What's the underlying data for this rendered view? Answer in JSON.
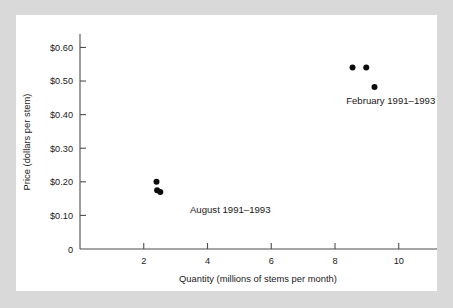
{
  "chart_data": {
    "type": "scatter",
    "title": "",
    "xlabel": "Quantity (millions of stems per month)",
    "ylabel": "Price (dollars per stem)",
    "xlim": [
      0,
      11.2
    ],
    "ylim": [
      0,
      0.64
    ],
    "xticks": [
      "2",
      "4",
      "6",
      "8",
      "10"
    ],
    "xtick_values": [
      2,
      4,
      6,
      8,
      10
    ],
    "yticks": [
      "$0.10",
      "$0.20",
      "$0.30",
      "$0.40",
      "$0.50",
      "$0.60"
    ],
    "ytick_values": [
      0.1,
      0.2,
      0.3,
      0.4,
      0.5,
      0.6
    ],
    "origin_label": "0",
    "grid": false,
    "legend_position": "inline-annotation",
    "series": [
      {
        "name": "August 1991–1993",
        "annotation": "August 1991–1993",
        "annotation_x": 3.45,
        "annotation_y": 0.108,
        "points": [
          {
            "x": 2.4,
            "y": 0.2
          },
          {
            "x": 2.42,
            "y": 0.175
          },
          {
            "x": 2.52,
            "y": 0.17
          }
        ]
      },
      {
        "name": "February 1991–1993",
        "annotation": "February 1991–1993",
        "annotation_x": 8.35,
        "annotation_y": 0.432,
        "points": [
          {
            "x": 8.55,
            "y": 0.54
          },
          {
            "x": 8.98,
            "y": 0.54
          },
          {
            "x": 9.24,
            "y": 0.482
          }
        ]
      }
    ],
    "colors": {
      "point": "#0d0d0d",
      "axis": "#4d4d4d",
      "text": "#1a1a1a",
      "panel_background": "#ffffff",
      "figure_background": "#d9d9d9"
    }
  }
}
